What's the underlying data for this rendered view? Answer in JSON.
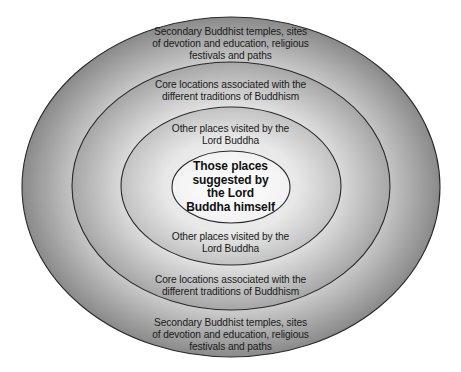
{
  "diagram": {
    "type": "concentric-ellipses",
    "rings": [
      {
        "level": 1,
        "name": "outer",
        "label_top": [
          "Secondary Buddhist temples, sites",
          "of devotion and education, religious",
          "festivals and paths"
        ],
        "label_bottom": [
          "Secondary Buddhist temples, sites",
          "of devotion and education, religious",
          "festivals and paths"
        ]
      },
      {
        "level": 2,
        "name": "core",
        "label_top": [
          "Core locations associated with the",
          "different traditions of Buddhism"
        ],
        "label_bottom": [
          "Core locations associated with the",
          "different traditions of Buddhism"
        ]
      },
      {
        "level": 3,
        "name": "visited",
        "label_top": [
          "Other places visited by the",
          "Lord Buddha"
        ],
        "label_bottom": [
          "Other places visited by the",
          "Lord Buddha"
        ]
      }
    ],
    "center": {
      "label": [
        "Those places",
        "suggested by",
        "the Lord",
        "Buddha himself"
      ]
    },
    "colors": {
      "outline": "#2a2a2a",
      "ring1_edge": "#8c8c8c",
      "ring1_inner": "#d4d4d4",
      "ring2_edge": "#a9a9a9",
      "ring2_inner": "#e2e2e2",
      "ring3_edge": "#c4c4c4",
      "ring3_inner": "#eeeeee",
      "center_fill": "#fbfbfb",
      "text": "#1a1a1a"
    }
  }
}
